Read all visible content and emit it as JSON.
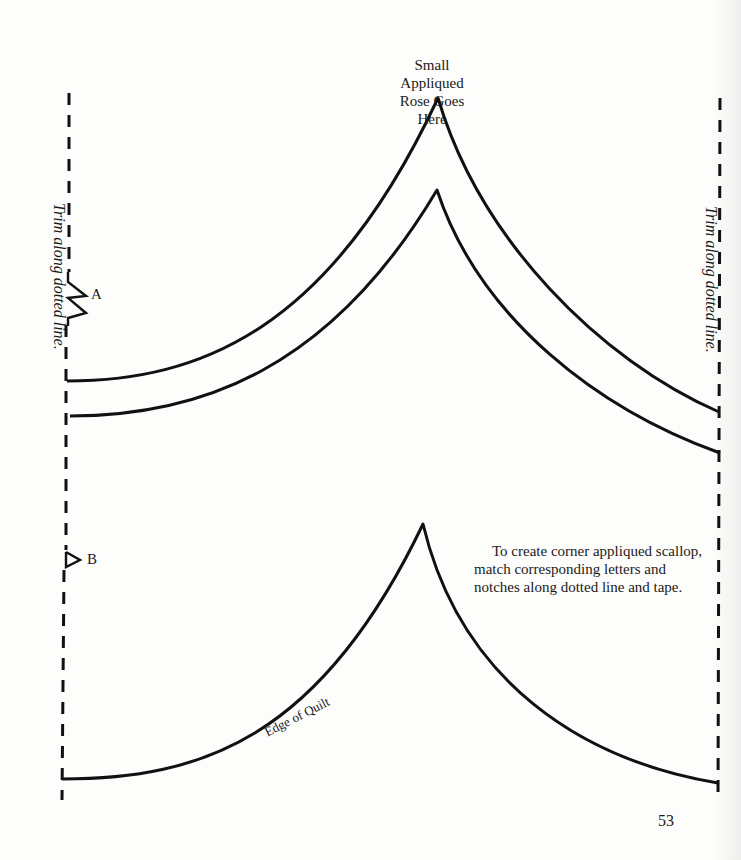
{
  "page": {
    "top_label_line1": "Small Appliqued",
    "top_label_line2": "Rose Goes Here",
    "trim_left": "Trim along dotted line.",
    "trim_right": "Trim along dotted line.",
    "notch_a_label": "A",
    "notch_b_label": "B",
    "instructions": "To create corner appliqued scallop, match corresponding letters and notches along dotted line and tape.",
    "edge_label": "Edge of Quilt",
    "page_number": "53"
  },
  "colors": {
    "ink": "#111111",
    "paper": "#fdfdfc"
  },
  "shapes": {
    "dotted_trim_lines": [
      "left-trim-line",
      "right-trim-line"
    ],
    "scallop_outlines": [
      "outer-appliqued-scallop",
      "inner-appliqued-scallop",
      "edge-of-quilt-scallop"
    ],
    "notches": [
      "double-notch-a",
      "single-notch-b"
    ]
  }
}
